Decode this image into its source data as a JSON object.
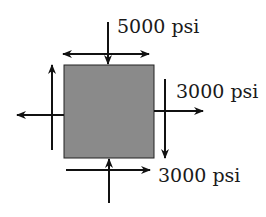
{
  "diagram": {
    "element": {
      "fill": "#8a8a8a",
      "stroke": "#222222"
    },
    "labels": {
      "top_normal": "5000 psi",
      "right_shear": "3000 psi",
      "bottom_shear": "3000 psi"
    },
    "arrow_color": "#111111"
  }
}
